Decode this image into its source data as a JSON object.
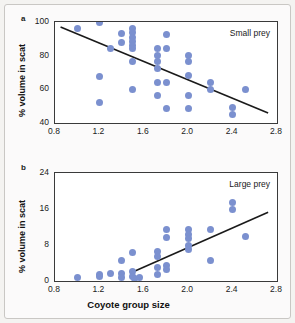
{
  "figure": {
    "xlabel": "Coyote group size",
    "panel_a_letter": "a",
    "panel_b_letter": "b"
  },
  "chart_data": [
    {
      "type": "scatter",
      "panel": "a",
      "title": "",
      "annotation": "Small prey",
      "xlabel": "Coyote group size",
      "ylabel": "% volume in scat",
      "xlim": [
        0.8,
        2.8
      ],
      "ylim": [
        40,
        100
      ],
      "xticks": [
        0.8,
        1.2,
        1.6,
        2.0,
        2.4,
        2.8
      ],
      "yticks": [
        40,
        60,
        80,
        100
      ],
      "xtick_labels": [
        "0.8",
        "1.2",
        "1.6",
        "2.0",
        "2.4",
        "2.8"
      ],
      "ytick_labels": [
        "40",
        "60",
        "80",
        "100"
      ],
      "grid": false,
      "legend": "none",
      "marker_color": "#7b90cf",
      "trendline_color": "#1a1a1a",
      "trendline": {
        "x0": 0.85,
        "y0": 97.0,
        "x1": 2.72,
        "y1": 46.0
      },
      "points": [
        {
          "x": 1.0,
          "y": 96.0
        },
        {
          "x": 1.2,
          "y": 100.0
        },
        {
          "x": 1.2,
          "y": 67.5
        },
        {
          "x": 1.2,
          "y": 52.0
        },
        {
          "x": 1.3,
          "y": 84.0
        },
        {
          "x": 1.4,
          "y": 93.0
        },
        {
          "x": 1.4,
          "y": 88.0
        },
        {
          "x": 1.5,
          "y": 96.0
        },
        {
          "x": 1.5,
          "y": 93.5
        },
        {
          "x": 1.5,
          "y": 91.0
        },
        {
          "x": 1.5,
          "y": 88.5
        },
        {
          "x": 1.5,
          "y": 86.0
        },
        {
          "x": 1.5,
          "y": 84.0
        },
        {
          "x": 1.5,
          "y": 76.5
        },
        {
          "x": 1.5,
          "y": 60.0
        },
        {
          "x": 1.72,
          "y": 84.5
        },
        {
          "x": 1.72,
          "y": 80.0
        },
        {
          "x": 1.72,
          "y": 76.5
        },
        {
          "x": 1.72,
          "y": 72.5
        },
        {
          "x": 1.72,
          "y": 64.0
        },
        {
          "x": 1.72,
          "y": 56.5
        },
        {
          "x": 1.8,
          "y": 92.5
        },
        {
          "x": 1.8,
          "y": 84.5
        },
        {
          "x": 1.8,
          "y": 64.0
        },
        {
          "x": 1.8,
          "y": 48.5
        },
        {
          "x": 2.0,
          "y": 80.0
        },
        {
          "x": 2.0,
          "y": 76.5
        },
        {
          "x": 2.0,
          "y": 68.0
        },
        {
          "x": 2.0,
          "y": 56.5
        },
        {
          "x": 2.0,
          "y": 48.5
        },
        {
          "x": 2.2,
          "y": 64.0
        },
        {
          "x": 2.2,
          "y": 60.0
        },
        {
          "x": 2.4,
          "y": 49.0
        },
        {
          "x": 2.4,
          "y": 45.0
        },
        {
          "x": 2.52,
          "y": 60.0
        }
      ]
    },
    {
      "type": "scatter",
      "panel": "b",
      "title": "",
      "annotation": "Large prey",
      "xlabel": "Coyote group size",
      "ylabel": "% volume in scat",
      "xlim": [
        0.8,
        2.8
      ],
      "ylim": [
        0,
        24
      ],
      "xticks": [
        0.8,
        1.2,
        1.6,
        2.0,
        2.4,
        2.8
      ],
      "yticks": [
        0,
        8,
        16,
        24
      ],
      "xtick_labels": [
        "0.8",
        "1.2",
        "1.6",
        "2.0",
        "2.4",
        "2.8"
      ],
      "ytick_labels": [
        "0",
        "8",
        "16",
        "24"
      ],
      "grid": false,
      "legend": "none",
      "marker_color": "#7b90cf",
      "trendline_color": "#1a1a1a",
      "trendline": {
        "x0": 1.5,
        "y0": 2.0,
        "x1": 2.72,
        "y1": 15.3
      },
      "points": [
        {
          "x": 1.0,
          "y": 0.8
        },
        {
          "x": 1.2,
          "y": 1.5
        },
        {
          "x": 1.2,
          "y": 0.9
        },
        {
          "x": 1.3,
          "y": 1.6
        },
        {
          "x": 1.4,
          "y": 4.6
        },
        {
          "x": 1.4,
          "y": 1.6
        },
        {
          "x": 1.4,
          "y": 0.7
        },
        {
          "x": 1.5,
          "y": 6.4
        },
        {
          "x": 1.5,
          "y": 2.1
        },
        {
          "x": 1.5,
          "y": 1.0
        },
        {
          "x": 1.52,
          "y": 0.6
        },
        {
          "x": 1.56,
          "y": 0.8
        },
        {
          "x": 1.72,
          "y": 6.6
        },
        {
          "x": 1.72,
          "y": 5.4
        },
        {
          "x": 1.72,
          "y": 3.0
        },
        {
          "x": 1.72,
          "y": 1.4
        },
        {
          "x": 1.8,
          "y": 11.4
        },
        {
          "x": 1.8,
          "y": 9.6
        },
        {
          "x": 1.8,
          "y": 3.4
        },
        {
          "x": 1.8,
          "y": 2.6
        },
        {
          "x": 2.0,
          "y": 11.4
        },
        {
          "x": 2.0,
          "y": 10.4
        },
        {
          "x": 2.0,
          "y": 9.5
        },
        {
          "x": 2.0,
          "y": 7.8
        },
        {
          "x": 2.0,
          "y": 7.0
        },
        {
          "x": 2.2,
          "y": 11.4
        },
        {
          "x": 2.2,
          "y": 4.6
        },
        {
          "x": 2.4,
          "y": 17.4
        },
        {
          "x": 2.4,
          "y": 15.9
        },
        {
          "x": 2.52,
          "y": 9.8
        }
      ]
    }
  ]
}
